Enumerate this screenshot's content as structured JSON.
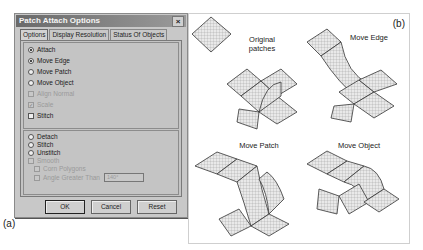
{
  "dialog": {
    "title": "Patch Attach Options",
    "close_glyph": "×",
    "tabs": [
      {
        "label": "Options",
        "active": true
      },
      {
        "label": "Display Resolution",
        "active": false
      },
      {
        "label": "Status Of Objects",
        "active": false
      }
    ],
    "group1": [
      {
        "type": "radio",
        "label": "Attach",
        "checked": true,
        "enabled": true
      },
      {
        "type": "radio",
        "label": "Move Edge",
        "checked": true,
        "enabled": true
      },
      {
        "type": "radio",
        "label": "Move Patch",
        "checked": false,
        "enabled": true
      },
      {
        "type": "radio",
        "label": "Move Object",
        "checked": false,
        "enabled": true
      },
      {
        "type": "checkbox",
        "label": "Align Normal",
        "checked": false,
        "enabled": false
      },
      {
        "type": "checkbox",
        "label": "Scale",
        "checked": true,
        "enabled": false
      },
      {
        "type": "checkbox",
        "label": "Stitch",
        "checked": false,
        "enabled": true
      }
    ],
    "group2": [
      {
        "type": "radio",
        "label": "Detach",
        "checked": false,
        "enabled": true
      },
      {
        "type": "radio",
        "label": "Stitch",
        "checked": false,
        "enabled": true
      },
      {
        "type": "radio",
        "label": "Unstitch",
        "checked": false,
        "enabled": true
      },
      {
        "type": "checkbox",
        "label": "Smooth",
        "checked": false,
        "enabled": false
      },
      {
        "type": "checkbox",
        "label": "Corn Polygons",
        "checked": false,
        "enabled": false
      },
      {
        "type": "checkbox",
        "label": "Angle Greater Than",
        "checked": false,
        "enabled": false,
        "field_value": "140°"
      }
    ],
    "buttons": {
      "ok": "OK",
      "cancel": "Cancel",
      "reset": "Reset"
    }
  },
  "figure": {
    "label_a": "(a)",
    "label_b": "(b)",
    "captions": {
      "original": "Original patches",
      "move_edge": "Move Edge",
      "move_patch": "Move Patch",
      "move_object": "Move Object"
    }
  }
}
